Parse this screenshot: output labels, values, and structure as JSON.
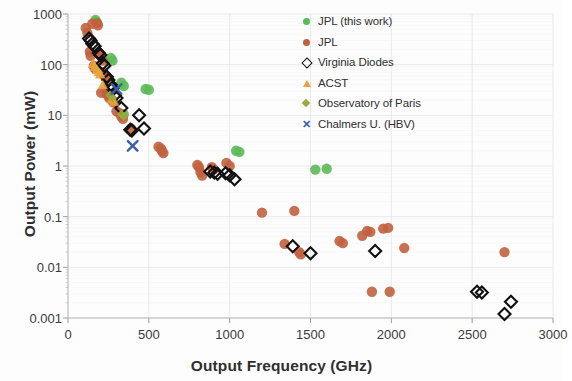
{
  "figure": {
    "background": "#fdfdfd",
    "plot_area": {
      "left": 68,
      "top": 14,
      "right": 553,
      "bottom": 318
    }
  },
  "chart_data": {
    "type": "scatter",
    "title": "",
    "xlabel": "Output Frequency (GHz)",
    "ylabel": "Output Power (mW)",
    "xlim": [
      0,
      3000
    ],
    "ylim": [
      0.001,
      1000
    ],
    "yscale": "log",
    "xscale": "linear",
    "xticks": [
      0,
      500,
      1000,
      1500,
      2000,
      2500,
      3000
    ],
    "xtick_labels": [
      "0",
      "500",
      "1000",
      "1500",
      "2000",
      "2500",
      "3000"
    ],
    "yticks": [
      0.001,
      0.01,
      0.1,
      1,
      10,
      100,
      1000
    ],
    "ytick_labels": [
      "0.001",
      "0.01",
      "0.1",
      "1",
      "10",
      "100",
      "1000"
    ],
    "grid": true,
    "grid_color": "#e3e3e3",
    "minor_ticks": true,
    "legend_position": "top-right",
    "series": [
      {
        "name": "JPL (this work)",
        "marker": "circle",
        "color": "#5cba57",
        "points": [
          [
            170,
            760
          ],
          [
            175,
            700
          ],
          [
            265,
            135
          ],
          [
            275,
            120
          ],
          [
            330,
            44
          ],
          [
            345,
            38
          ],
          [
            480,
            33
          ],
          [
            500,
            32
          ],
          [
            345,
            10.5
          ],
          [
            1040,
            2.0
          ],
          [
            1060,
            1.9
          ],
          [
            1530,
            0.85
          ],
          [
            1600,
            0.88
          ]
        ]
      },
      {
        "name": "JPL",
        "marker": "circle",
        "color": "#c1603f",
        "points": [
          [
            110,
            530
          ],
          [
            120,
            420
          ],
          [
            150,
            640
          ],
          [
            180,
            660
          ],
          [
            185,
            600
          ],
          [
            135,
            180
          ],
          [
            140,
            150
          ],
          [
            190,
            175
          ],
          [
            200,
            155
          ],
          [
            160,
            95
          ],
          [
            165,
            85
          ],
          [
            215,
            120
          ],
          [
            215,
            70
          ],
          [
            225,
            60
          ],
          [
            250,
            52
          ],
          [
            205,
            28
          ],
          [
            235,
            30
          ],
          [
            240,
            26
          ],
          [
            255,
            22
          ],
          [
            275,
            20
          ],
          [
            280,
            18
          ],
          [
            300,
            12
          ],
          [
            320,
            11
          ],
          [
            330,
            9.5
          ],
          [
            340,
            8.5
          ],
          [
            390,
            5.5
          ],
          [
            560,
            2.4
          ],
          [
            575,
            2.2
          ],
          [
            580,
            2.0
          ],
          [
            590,
            1.8
          ],
          [
            800,
            1.05
          ],
          [
            810,
            0.95
          ],
          [
            820,
            0.75
          ],
          [
            830,
            0.65
          ],
          [
            890,
            0.95
          ],
          [
            900,
            0.85
          ],
          [
            980,
            1.15
          ],
          [
            1000,
            1.0
          ],
          [
            1200,
            0.12
          ],
          [
            1400,
            0.13
          ],
          [
            1340,
            0.029
          ],
          [
            1430,
            0.02
          ],
          [
            1440,
            0.018
          ],
          [
            1680,
            0.033
          ],
          [
            1700,
            0.03
          ],
          [
            1820,
            0.042
          ],
          [
            1850,
            0.052
          ],
          [
            1870,
            0.05
          ],
          [
            1950,
            0.058
          ],
          [
            1980,
            0.06
          ],
          [
            1880,
            0.0033
          ],
          [
            1990,
            0.0033
          ],
          [
            2080,
            0.024
          ],
          [
            2700,
            0.02
          ]
        ]
      },
      {
        "name": "Virginia Diodes",
        "marker": "diamond-open",
        "color": "#111111",
        "points": [
          [
            130,
            330
          ],
          [
            140,
            300
          ],
          [
            150,
            260
          ],
          [
            165,
            230
          ],
          [
            190,
            170
          ],
          [
            200,
            155
          ],
          [
            215,
            105
          ],
          [
            225,
            95
          ],
          [
            240,
            58
          ],
          [
            250,
            50
          ],
          [
            265,
            40
          ],
          [
            275,
            34
          ],
          [
            290,
            25
          ],
          [
            300,
            22
          ],
          [
            330,
            14
          ],
          [
            385,
            5.2
          ],
          [
            395,
            5.0
          ],
          [
            440,
            10.0
          ],
          [
            470,
            5.5
          ],
          [
            880,
            0.78
          ],
          [
            905,
            0.74
          ],
          [
            925,
            0.7
          ],
          [
            975,
            0.72
          ],
          [
            1000,
            0.66
          ],
          [
            1030,
            0.55
          ],
          [
            1390,
            0.026
          ],
          [
            1500,
            0.019
          ],
          [
            1900,
            0.021
          ],
          [
            2530,
            0.0033
          ],
          [
            2560,
            0.0032
          ],
          [
            2700,
            0.0012
          ],
          [
            2740,
            0.0021
          ]
        ]
      },
      {
        "name": "ACST",
        "marker": "triangle",
        "color": "#e8a33d",
        "points": [
          [
            155,
            105
          ],
          [
            165,
            92
          ],
          [
            180,
            80
          ],
          [
            190,
            72
          ],
          [
            200,
            65
          ],
          [
            215,
            40
          ],
          [
            270,
            21
          ],
          [
            285,
            19
          ]
        ]
      },
      {
        "name": "Observatory of Paris",
        "marker": "diamond-fill",
        "color": "#9aab3c",
        "points": [
          [
            260,
            25
          ],
          [
            275,
            22
          ],
          [
            330,
            10.5
          ],
          [
            345,
            9.5
          ]
        ]
      },
      {
        "name": "Chalmers U. (HBV)",
        "marker": "cross",
        "color": "#3b5fa8",
        "points": [
          [
            300,
            33
          ],
          [
            400,
            2.5
          ]
        ]
      }
    ]
  },
  "legend": {
    "items": [
      {
        "label": "JPL (this work)",
        "marker": "circle",
        "color": "#5cba57"
      },
      {
        "label": "JPL",
        "marker": "circle",
        "color": "#c1603f"
      },
      {
        "label": "Virginia Diodes",
        "marker": "diamond-open",
        "color": "#111111"
      },
      {
        "label": "ACST",
        "marker": "triangle",
        "color": "#e8a33d"
      },
      {
        "label": "Observatory of Paris",
        "marker": "diamond-fill",
        "color": "#9aab3c"
      },
      {
        "label": "Chalmers U. (HBV)",
        "marker": "cross",
        "color": "#3b5fa8"
      }
    ]
  }
}
